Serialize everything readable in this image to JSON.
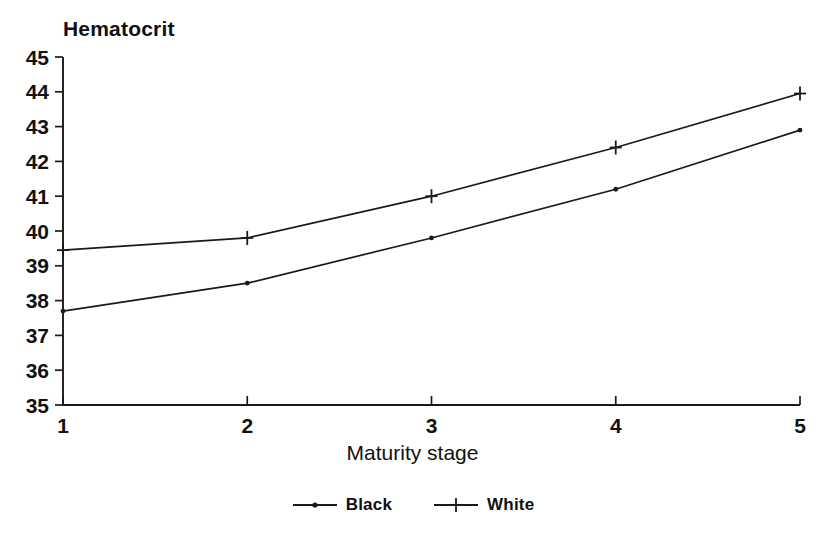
{
  "chart_data": {
    "type": "line",
    "title": "Hematocrit",
    "xlabel": "Maturity stage",
    "ylabel": "Hematocrit",
    "categories": [
      "1",
      "2",
      "3",
      "4",
      "5"
    ],
    "x": [
      1,
      2,
      3,
      4,
      5
    ],
    "xlim": [
      1,
      5
    ],
    "ylim": [
      35,
      45
    ],
    "y_ticks": [
      "45",
      "44",
      "43",
      "42",
      "41",
      "40",
      "39",
      "38",
      "37",
      "36",
      "35"
    ],
    "y_tick_values": [
      45,
      44,
      43,
      42,
      41,
      40,
      39,
      38,
      37,
      36,
      35
    ],
    "x_ticks": [
      "1",
      "2",
      "3",
      "4",
      "5"
    ],
    "grid": false,
    "legend_position": "bottom-center",
    "series": [
      {
        "name": "Black",
        "marker": "dot",
        "color": "#1a1a1a",
        "values": [
          37.7,
          38.5,
          39.8,
          41.2,
          42.9
        ]
      },
      {
        "name": "White",
        "marker": "plus",
        "color": "#1a1a1a",
        "values": [
          39.45,
          39.8,
          41.0,
          42.4,
          43.95
        ]
      }
    ]
  },
  "legend": {
    "entries": [
      {
        "label": "Black",
        "marker": "dot-marker-icon"
      },
      {
        "label": "White",
        "marker": "plus-marker-icon"
      }
    ]
  }
}
